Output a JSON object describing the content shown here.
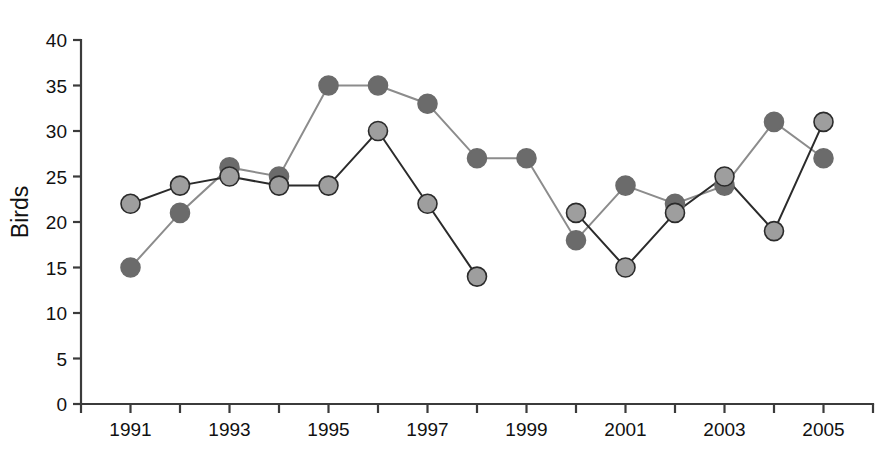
{
  "chart_data": {
    "type": "line",
    "title": "",
    "subtitle": "",
    "xlabel": "",
    "ylabel": "Birds",
    "x": [
      1991,
      1992,
      1993,
      1994,
      1995,
      1996,
      1997,
      1998,
      1999,
      2000,
      2001,
      2002,
      2003,
      2004,
      2005
    ],
    "xlim": [
      1990,
      2006
    ],
    "ylim": [
      0,
      40
    ],
    "xtick_values": [
      1990,
      1991,
      1992,
      1993,
      1994,
      1995,
      1996,
      1997,
      1998,
      1999,
      2000,
      2001,
      2002,
      2003,
      2004,
      2005,
      2006
    ],
    "xtick_labels": [
      "1991",
      "1993",
      "1995",
      "1997",
      "1999",
      "2001",
      "2003",
      "2005"
    ],
    "xtick_labeled_values": [
      1991,
      1993,
      1995,
      1997,
      1999,
      2001,
      2003,
      2005
    ],
    "ytick_values": [
      0,
      5,
      10,
      15,
      20,
      25,
      30,
      35,
      40
    ],
    "ytick_labels": [
      "0",
      "5",
      "10",
      "15",
      "20",
      "25",
      "30",
      "35",
      "40"
    ],
    "grid": false,
    "legend": "none",
    "marker": "filled-circle",
    "series": [
      {
        "name": "dark-series",
        "color": "#6b6b6b",
        "line_color": "#8c8c8c",
        "marker_edge_color": "#6b6b6b",
        "x": [
          1991,
          1992,
          1993,
          1994,
          1995,
          1996,
          1997,
          1998,
          1999,
          2000,
          2001,
          2002,
          2003,
          2004,
          2005
        ],
        "values": [
          15,
          21,
          26,
          25,
          35,
          35,
          33,
          27,
          27,
          18,
          24,
          22,
          24,
          31,
          27
        ]
      },
      {
        "name": "light-series",
        "color": "#9e9e9e",
        "line_color": "#2b2b2b",
        "marker_edge_color": "#2b2b2b",
        "x": [
          1991,
          1992,
          1993,
          1994,
          1995,
          1996,
          1997,
          1998,
          2000,
          2001,
          2002,
          2003,
          2004,
          2005
        ],
        "values": [
          22,
          24,
          25,
          24,
          24,
          30,
          22,
          14,
          21,
          15,
          21,
          25,
          19,
          31
        ],
        "segments": [
          [
            1991,
            1992,
            1993,
            1994,
            1995,
            1996,
            1997,
            1998
          ],
          [
            2000,
            2001,
            2002,
            2003,
            2004,
            2005
          ]
        ]
      }
    ]
  },
  "axes": {
    "y_axis_title": "Birds"
  }
}
